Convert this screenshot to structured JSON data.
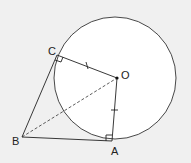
{
  "diagram": {
    "type": "circle-tangents",
    "background": "#f0f0f0",
    "circle": {
      "cx": 115,
      "cy": 78,
      "r": 61,
      "fill": "#ffffff",
      "stroke": "#333333"
    },
    "points": {
      "O": {
        "label": "O",
        "x": 117,
        "y": 78
      },
      "A": {
        "label": "A",
        "x": 112,
        "y": 141
      },
      "B": {
        "label": "B",
        "x": 22,
        "y": 137
      },
      "C": {
        "label": "C",
        "x": 57,
        "y": 55
      }
    },
    "segments": [
      {
        "from": "O",
        "to": "C",
        "style": "solid",
        "mark": "single-tick"
      },
      {
        "from": "O",
        "to": "A",
        "style": "solid",
        "mark": "single-tick"
      },
      {
        "from": "B",
        "to": "C",
        "style": "solid",
        "mark": "none"
      },
      {
        "from": "B",
        "to": "A",
        "style": "solid",
        "mark": "none"
      },
      {
        "from": "B",
        "to": "O",
        "style": "dashed",
        "mark": "none"
      }
    ],
    "right_angles": [
      "C",
      "A"
    ]
  }
}
